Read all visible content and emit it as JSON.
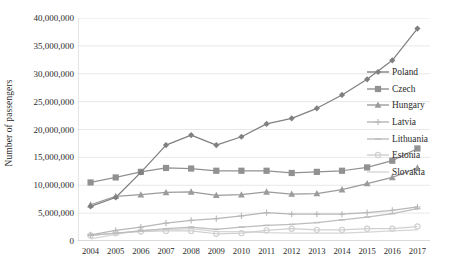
{
  "chart_data": {
    "type": "line",
    "title": "",
    "xlabel": "",
    "ylabel": "Number of passengers",
    "categories": [
      "2004",
      "2005",
      "2006",
      "2007",
      "2008",
      "2009",
      "2010",
      "2011",
      "2012",
      "2013",
      "2014",
      "2015",
      "2016",
      "2017"
    ],
    "ylim": [
      0,
      40000000
    ],
    "ytick_values": [
      0,
      5000000,
      10000000,
      15000000,
      20000000,
      25000000,
      30000000,
      35000000,
      40000000
    ],
    "ytick_labels": [
      "0",
      "5,000,000",
      "10,000,000",
      "15,000,000",
      "20,000,000",
      "25,000,000",
      "30,000,000",
      "35,000,000",
      "40,000,000"
    ],
    "grid": true,
    "legend_position": "right",
    "series": [
      {
        "name": "Poland",
        "marker": "diamond",
        "color": "#808080",
        "values": [
          6200000,
          7800000,
          12300000,
          17200000,
          19000000,
          17200000,
          18700000,
          21000000,
          22000000,
          23800000,
          26200000,
          29000000,
          32400000,
          38100000
        ]
      },
      {
        "name": "Czech",
        "marker": "square",
        "color": "#919191",
        "values": [
          10500000,
          11400000,
          12400000,
          13100000,
          13000000,
          12600000,
          12600000,
          12600000,
          12200000,
          12400000,
          12600000,
          13200000,
          14400000,
          16600000
        ]
      },
      {
        "name": "Hungary",
        "marker": "triangle",
        "color": "#9b9b9b",
        "values": [
          6500000,
          8000000,
          8300000,
          8700000,
          8800000,
          8200000,
          8300000,
          8800000,
          8400000,
          8500000,
          9200000,
          10300000,
          11400000,
          13100000
        ]
      },
      {
        "name": "Latvia",
        "marker": "cross",
        "color": "#b7b7b7",
        "values": [
          1100000,
          1900000,
          2500000,
          3200000,
          3700000,
          4000000,
          4500000,
          5100000,
          4800000,
          4800000,
          4800000,
          5100000,
          5500000,
          6100000
        ]
      },
      {
        "name": "Lithuania",
        "marker": "dash",
        "color": "#bdbdbd",
        "values": [
          1000000,
          1400000,
          1800000,
          2200000,
          2500000,
          2100000,
          2500000,
          2800000,
          3000000,
          3300000,
          3800000,
          4300000,
          4900000,
          5800000
        ]
      },
      {
        "name": "Estonia",
        "marker": "circle",
        "color": "#cfcfcf",
        "values": [
          1000000,
          1400000,
          1700000,
          1800000,
          1800000,
          1300000,
          1400000,
          1900000,
          2200000,
          2000000,
          2000000,
          2200000,
          2200000,
          2600000
        ]
      },
      {
        "name": "Slovakia",
        "marker": "none",
        "color": "#d6d6d6",
        "values": [
          400000,
          1200000,
          1900000,
          2000000,
          2200000,
          1700000,
          1700000,
          1500000,
          1400000,
          1400000,
          1400000,
          1600000,
          1800000,
          2000000
        ]
      }
    ]
  },
  "legend": {
    "items": [
      {
        "label": "Poland"
      },
      {
        "label": "Czech"
      },
      {
        "label": "Hungary"
      },
      {
        "label": "Latvia"
      },
      {
        "label": "Lithuania"
      },
      {
        "label": "Estonia"
      },
      {
        "label": "Slovakia"
      }
    ]
  },
  "axes": {
    "y_title": "Number of passengers"
  }
}
